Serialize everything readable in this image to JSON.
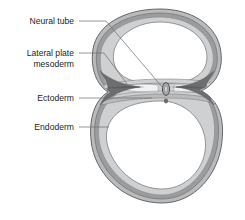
{
  "figure": {
    "background_color": "#ffffff"
  },
  "labels": [
    {
      "id": "neural-tube",
      "text": "Neural tube",
      "text_x": 74,
      "text_y": 24,
      "anchor": "end",
      "leader": "M79,21 L105,21 L163,88",
      "target_x": 163,
      "target_y": 88
    },
    {
      "id": "lateral-plate-mesoderm",
      "text": "Lateral plate",
      "text_x": 74,
      "text_y": 56,
      "anchor": "end",
      "leader": "M79,53 L103,53 L128,84",
      "target_x": 128,
      "target_y": 84
    },
    {
      "id": "lateral-plate-mesoderm-line2",
      "text": "mesoderm",
      "text_x": 74,
      "text_y": 67,
      "anchor": "end",
      "leader": "",
      "target_x": 0,
      "target_y": 0
    },
    {
      "id": "ectoderm",
      "text": "Ectoderm",
      "text_x": 74,
      "text_y": 101,
      "anchor": "end",
      "leader": "M79,98 L152,98",
      "target_x": 152,
      "target_y": 98
    },
    {
      "id": "endoderm",
      "text": "Endoderm",
      "text_x": 74,
      "text_y": 130,
      "anchor": "end",
      "leader": "M79,127 L108,127",
      "target_x": 108,
      "target_y": 127
    }
  ],
  "colors": {
    "label_text": "#231f20",
    "leader_line": "#6b6b6b",
    "outline": "#58595b",
    "outer_layer": "#b9babc",
    "middle_layer": "#9b9c9e",
    "inner_layer": "#cfd0d1",
    "lumen": "#ffffff",
    "mesoderm_dark": "#6d6e70",
    "neural_tube_fill": "#a7a8aa",
    "neural_tube_outline": "#414042"
  },
  "structures": [
    {
      "id": "upper-loop",
      "name": "upper-amniotic-cavity",
      "description": "Upper rounded loop lumen"
    },
    {
      "id": "lower-loop",
      "name": "lower-yolk-sac-cavity",
      "description": "Lower rounded loop lumen"
    },
    {
      "id": "neural-tube-oval",
      "name": "neural-tube",
      "cx": 166,
      "cy": 92,
      "rx": 3.4,
      "ry": 6.2
    },
    {
      "id": "mesoderm-left",
      "name": "lateral-plate-mesoderm-left"
    },
    {
      "id": "mesoderm-right",
      "name": "lateral-plate-mesoderm-right"
    }
  ]
}
